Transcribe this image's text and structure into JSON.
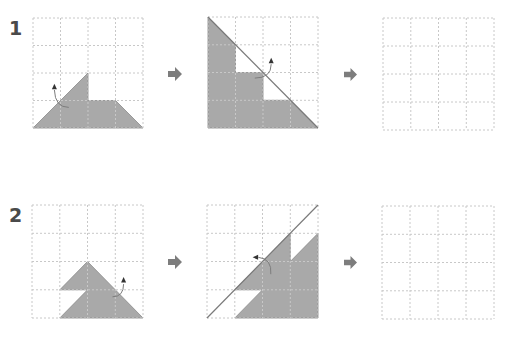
{
  "rows": [
    {
      "label": "1",
      "panels": [
        {
          "name": "row1-step1",
          "shape_points": [
            [
              0,
              4
            ],
            [
              2,
              2
            ],
            [
              2,
              3
            ],
            [
              3,
              3
            ],
            [
              4,
              4
            ]
          ],
          "fold_line": null,
          "hole_points": null,
          "curve_arrow": "up"
        },
        {
          "name": "row1-step2",
          "shape_points": [
            [
              0,
              0
            ],
            [
              1,
              1
            ],
            [
              1,
              2
            ],
            [
              2,
              2
            ],
            [
              2,
              3
            ],
            [
              3,
              3
            ],
            [
              4,
              4
            ],
            [
              0,
              4
            ]
          ],
          "fold_line": [
            [
              0,
              0
            ],
            [
              4,
              4
            ]
          ],
          "hole_points": null,
          "curve_arrow": "up"
        },
        {
          "name": "row1-answer",
          "shape_points": null,
          "fold_line": null,
          "hole_points": null,
          "curve_arrow": null
        }
      ]
    },
    {
      "label": "2",
      "panels": [
        {
          "name": "row2-step1",
          "shape_points": [
            [
              1,
              4
            ],
            [
              2,
              3
            ],
            [
              1,
              3
            ],
            [
              2,
              2
            ],
            [
              4,
              4
            ]
          ],
          "fold_line": null,
          "hole_points": null,
          "curve_arrow": "up"
        },
        {
          "name": "row2-step2",
          "shape_points": [
            [
              1,
              4
            ],
            [
              2,
              3
            ],
            [
              1,
              3
            ],
            [
              3,
              1
            ],
            [
              3,
              2
            ],
            [
              4,
              1
            ],
            [
              4,
              4
            ]
          ],
          "fold_line": [
            [
              0,
              4
            ],
            [
              4,
              0
            ]
          ],
          "hole_points": null,
          "curve_arrow": "left"
        },
        {
          "name": "row2-answer",
          "shape_points": null,
          "fold_line": null,
          "hole_points": null,
          "curve_arrow": null
        }
      ]
    }
  ],
  "grid": {
    "cells": 4
  },
  "colors": {
    "shape_fill": "#a9a9a9",
    "shape_stroke": "#8a8a8a",
    "grid_line": "#c8c8c8",
    "fold_line": "#7a7a7a",
    "arrow": "#7d7d7d",
    "label": "#4a4a4a"
  }
}
